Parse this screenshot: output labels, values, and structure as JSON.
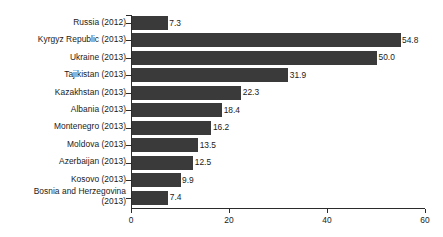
{
  "chart_data": {
    "type": "bar",
    "orientation": "horizontal",
    "title": "",
    "xlabel": "",
    "ylabel": "",
    "xlim": [
      0,
      60
    ],
    "grid": false,
    "legend": false,
    "bar_color": "#3a3a3a",
    "axis_color": "#2b2b2b",
    "xticks": [
      "0",
      "20",
      "40",
      "60"
    ],
    "xtick_values": [
      0,
      20,
      40,
      60
    ],
    "categories": [
      "Russia (2012)",
      "Kyrgyz Republic (2013)",
      "Ukraine (2013)",
      "Tajikistan (2013)",
      "Kazakhstan (2013)",
      "Albania (2013)",
      "Montenegro (2013)",
      "Moldova (2013)",
      "Azerbaijan (2013)",
      "Kosovo (2013)",
      "Bosnia and Herzegovina\n(2013)"
    ],
    "values": [
      7.3,
      54.8,
      50.0,
      31.9,
      22.3,
      18.4,
      16.2,
      13.5,
      12.5,
      9.9,
      7.4
    ],
    "value_labels": [
      "7.3",
      "54.8",
      "50.0",
      "31.9",
      "22.3",
      "18.4",
      "16.2",
      "13.5",
      "12.5",
      "9.9",
      "7.4"
    ]
  }
}
